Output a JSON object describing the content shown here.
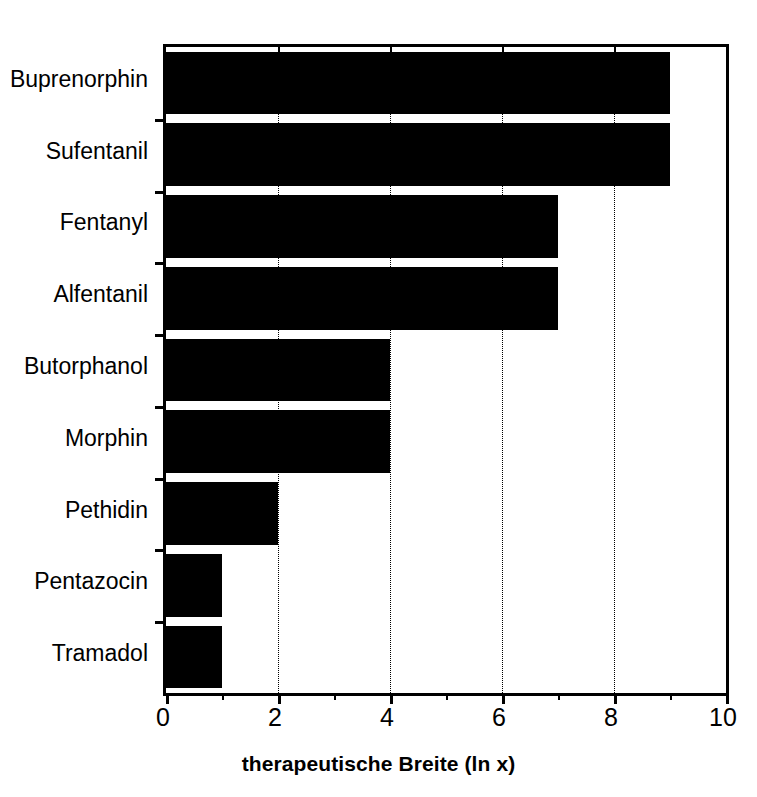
{
  "chart_data": {
    "type": "bar",
    "orientation": "horizontal",
    "title": "",
    "xlabel": "therapeutische Breite (ln x)",
    "ylabel": "",
    "xlim": [
      0,
      10
    ],
    "grid": "vertical-dotted-at-major-ticks",
    "legend": "none",
    "bar_color": "#000000",
    "background_color": "#ffffff",
    "xticks": [
      0,
      2,
      4,
      6,
      8,
      10
    ],
    "xticklabels": [
      "0",
      "2",
      "4",
      "6",
      "8",
      "10"
    ],
    "xminorticks": [
      1,
      3,
      5,
      7,
      9
    ],
    "categories": [
      "Buprenorphin",
      "Sufentanil",
      "Fentanyl",
      "Alfentanil",
      "Butorphanol",
      "Morphin",
      "Pethidin",
      "Pentazocin",
      "Tramadol"
    ],
    "values": [
      9,
      9,
      7,
      7,
      4,
      4,
      2,
      1,
      1
    ]
  }
}
